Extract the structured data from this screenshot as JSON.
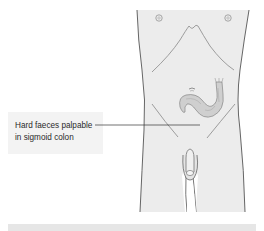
{
  "figure": {
    "annotation": {
      "line1": "Hard faeces palpable",
      "line2": "in sigmoid colon"
    },
    "colors": {
      "body_fill": "#ececec",
      "outline": "#555555",
      "colon_fill": "#cfcfcf",
      "label_bg": "#f3f3f3",
      "caption_bar": "#e6e6e6",
      "leader_line": "#333333"
    }
  }
}
